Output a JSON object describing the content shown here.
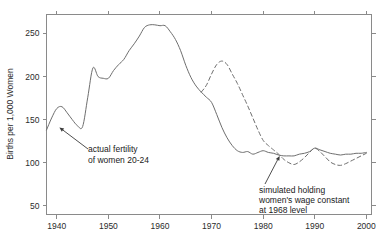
{
  "chart_data": {
    "type": "line",
    "title": "",
    "subtitle": "",
    "xlabel": "",
    "ylabel": "Births per 1,000 Women",
    "xlim": [
      1938,
      2001
    ],
    "ylim": [
      40,
      272
    ],
    "grid": false,
    "legend_position": "none",
    "x_ticks": [
      1940,
      1950,
      1960,
      1970,
      1980,
      1990,
      2000
    ],
    "x_tick_labels": [
      "1940",
      "1950",
      "1960",
      "1970",
      "1980",
      "1990",
      "2000"
    ],
    "y_ticks": [
      50,
      100,
      150,
      200,
      250
    ],
    "y_tick_labels": [
      "50",
      "100",
      "150",
      "200",
      "250"
    ],
    "series": [
      {
        "name": "actual fertility of women 20-24",
        "style": "solid",
        "color": "#6e6e6e",
        "x": [
          1938,
          1939,
          1940,
          1941,
          1942,
          1943,
          1944,
          1945,
          1946,
          1947,
          1948,
          1949,
          1950,
          1951,
          1952,
          1953,
          1954,
          1955,
          1956,
          1957,
          1958,
          1959,
          1960,
          1961,
          1962,
          1963,
          1964,
          1965,
          1966,
          1967,
          1968,
          1969,
          1970,
          1971,
          1972,
          1973,
          1974,
          1975,
          1976,
          1977,
          1978,
          1979,
          1980,
          1981,
          1982,
          1983,
          1984,
          1985,
          1986,
          1987,
          1988,
          1989,
          1990,
          1991,
          1992,
          1993,
          1994,
          1995,
          1996,
          1997,
          1998,
          1999,
          2000
        ],
        "y": [
          138,
          152,
          163,
          165,
          158,
          150,
          143,
          142,
          176,
          210,
          200,
          198,
          198,
          207,
          214,
          220,
          230,
          238,
          247,
          257,
          260,
          260,
          259,
          259,
          252,
          243,
          230,
          213,
          199,
          189,
          182,
          176,
          170,
          156,
          141,
          129,
          120,
          114,
          112,
          113,
          110,
          112,
          114,
          112,
          111,
          109,
          108,
          108,
          108,
          110,
          111,
          113,
          117,
          115,
          113,
          111,
          110,
          109,
          110,
          110,
          111,
          111,
          112
        ],
        "annotation": {
          "text_lines": [
            "actual fertility",
            "of women 20-24"
          ],
          "point_x": 1940.5,
          "point_y": 141
        }
      },
      {
        "name": "simulated holding women's wage constant at 1968 level",
        "style": "dashed",
        "color": "#6e6e6e",
        "x": [
          1968,
          1969,
          1970,
          1971,
          1972,
          1973,
          1974,
          1975,
          1976,
          1977,
          1978,
          1979,
          1980,
          1981,
          1982,
          1983,
          1984,
          1985,
          1986,
          1987,
          1988,
          1989,
          1990,
          1991,
          1992,
          1993,
          1994,
          1995,
          1996,
          1997,
          1998,
          1999,
          2000
        ],
        "y": [
          182,
          190,
          203,
          214,
          218,
          214,
          203,
          192,
          179,
          166,
          152,
          138,
          126,
          120,
          115,
          110,
          104,
          100,
          98,
          101,
          106,
          112,
          117,
          113,
          107,
          101,
          98,
          97,
          99,
          102,
          105,
          108,
          111
        ],
        "annotation": {
          "text_lines": [
            "simulated holding",
            "women's wage constant",
            "at 1968 level"
          ],
          "point_x": 1983.2,
          "point_y": 108
        }
      }
    ]
  },
  "axis": {
    "y_title": "Births per 1,000 Women"
  },
  "annotations": {
    "actual": {
      "line1": "actual fertility",
      "line2": "of women 20-24"
    },
    "simulated": {
      "line1": "simulated holding",
      "line2": "women's wage constant",
      "line3": "at 1968 level"
    }
  },
  "colors": {
    "line": "#6e6e6e",
    "frame": "#8a8a8a",
    "text": "#1a1a1a",
    "background": "#ffffff"
  }
}
